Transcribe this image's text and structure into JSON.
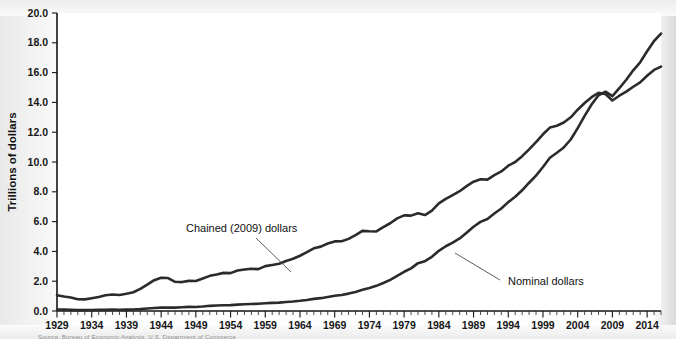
{
  "chart_data": {
    "type": "line",
    "title": "",
    "subtitle": "",
    "xlabel": "",
    "ylabel": "Trillions of dollars",
    "xlim": [
      1929,
      2016
    ],
    "ylim": [
      0.0,
      20.0
    ],
    "grid": false,
    "legend_position": "inline-annotations",
    "y_ticks": [
      "0.0",
      "2.0",
      "4.0",
      "6.0",
      "8.0",
      "10.0",
      "12.0",
      "14.0",
      "16.0",
      "18.0",
      "20.0"
    ],
    "y_tick_values": [
      0.0,
      2.0,
      4.0,
      6.0,
      8.0,
      10.0,
      12.0,
      14.0,
      16.0,
      18.0,
      20.0
    ],
    "x_ticks": [
      "1929",
      "1934",
      "1939",
      "1944",
      "1949",
      "1954",
      "1959",
      "1964",
      "1969",
      "1974",
      "1979",
      "1984",
      "1989",
      "1994",
      "1999",
      "2004",
      "2009",
      "2014"
    ],
    "x_tick_values": [
      1929,
      1934,
      1939,
      1944,
      1949,
      1954,
      1959,
      1964,
      1969,
      1974,
      1979,
      1984,
      1989,
      1994,
      1999,
      2004,
      2009,
      2014
    ],
    "x_minor_tick_step": 1,
    "annotations": [
      {
        "text": "Chained (2009) dollars",
        "series": "Chained (2009) dollars"
      },
      {
        "text": "Nominal dollars",
        "series": "Nominal dollars"
      }
    ],
    "x": [
      1929,
      1930,
      1931,
      1932,
      1933,
      1934,
      1935,
      1936,
      1937,
      1938,
      1939,
      1940,
      1941,
      1942,
      1943,
      1944,
      1945,
      1946,
      1947,
      1948,
      1949,
      1950,
      1951,
      1952,
      1953,
      1954,
      1955,
      1956,
      1957,
      1958,
      1959,
      1960,
      1961,
      1962,
      1963,
      1964,
      1965,
      1966,
      1967,
      1968,
      1969,
      1970,
      1971,
      1972,
      1973,
      1974,
      1975,
      1976,
      1977,
      1978,
      1979,
      1980,
      1981,
      1982,
      1983,
      1984,
      1985,
      1986,
      1987,
      1988,
      1989,
      1990,
      1991,
      1992,
      1993,
      1994,
      1995,
      1996,
      1997,
      1998,
      1999,
      2000,
      2001,
      2002,
      2003,
      2004,
      2005,
      2006,
      2007,
      2008,
      2009,
      2010,
      2011,
      2012,
      2013,
      2014,
      2015,
      2016
    ],
    "series": [
      {
        "name": "Chained (2009) dollars",
        "color": "#2b2b2b",
        "values": [
          1.06,
          0.97,
          0.91,
          0.79,
          0.78,
          0.86,
          0.94,
          1.06,
          1.11,
          1.07,
          1.16,
          1.26,
          1.49,
          1.77,
          2.07,
          2.23,
          2.21,
          1.96,
          1.94,
          2.02,
          2.01,
          2.18,
          2.36,
          2.45,
          2.56,
          2.54,
          2.72,
          2.78,
          2.84,
          2.81,
          3.01,
          3.09,
          3.17,
          3.36,
          3.51,
          3.71,
          3.95,
          4.21,
          4.32,
          4.53,
          4.67,
          4.68,
          4.84,
          5.09,
          5.38,
          5.35,
          5.34,
          5.63,
          5.89,
          6.22,
          6.42,
          6.4,
          6.56,
          6.44,
          6.73,
          7.22,
          7.52,
          7.78,
          8.04,
          8.38,
          8.68,
          8.84,
          8.82,
          9.12,
          9.37,
          9.75,
          10.0,
          10.39,
          10.85,
          11.33,
          11.86,
          12.31,
          12.43,
          12.65,
          13.0,
          13.51,
          13.96,
          14.35,
          14.64,
          14.56,
          14.13,
          14.45,
          14.72,
          15.05,
          15.34,
          15.79,
          16.18,
          16.4
        ]
      },
      {
        "name": "Nominal dollars",
        "color": "#2b2b2b",
        "values": [
          0.105,
          0.092,
          0.077,
          0.059,
          0.057,
          0.067,
          0.074,
          0.085,
          0.093,
          0.087,
          0.093,
          0.103,
          0.129,
          0.166,
          0.203,
          0.224,
          0.228,
          0.228,
          0.25,
          0.275,
          0.273,
          0.3,
          0.347,
          0.367,
          0.389,
          0.391,
          0.426,
          0.45,
          0.474,
          0.482,
          0.522,
          0.543,
          0.563,
          0.605,
          0.638,
          0.685,
          0.743,
          0.815,
          0.862,
          0.943,
          1.02,
          1.076,
          1.168,
          1.282,
          1.429,
          1.549,
          1.689,
          1.878,
          2.086,
          2.357,
          2.632,
          2.863,
          3.211,
          3.345,
          3.638,
          4.041,
          4.347,
          4.59,
          4.87,
          5.253,
          5.658,
          5.98,
          6.174,
          6.539,
          6.879,
          7.309,
          7.664,
          8.1,
          8.609,
          9.089,
          9.661,
          10.285,
          10.622,
          10.978,
          11.511,
          12.275,
          13.094,
          13.856,
          14.478,
          14.719,
          14.419,
          14.964,
          15.518,
          16.155,
          16.692,
          17.428,
          18.121,
          18.62
        ]
      }
    ]
  },
  "source": {
    "note": "Source: Bureau of Economic Analysis, U.S. Department of Commerce"
  }
}
